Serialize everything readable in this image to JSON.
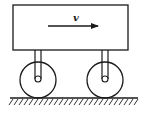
{
  "diagram": {
    "velocity_label": "v",
    "colors": {
      "stroke": "#1a1a1a",
      "background": "#ffffff"
    },
    "cart_body": {
      "x": 13,
      "y": 5,
      "width": 115,
      "height": 45
    },
    "velocity_arrow": {
      "x1": 48,
      "y1": 26,
      "x2": 98,
      "y2": 26,
      "label_x": 75,
      "label_y": 20
    },
    "wheels": [
      {
        "name": "left-wheel",
        "cx": 38,
        "cy": 80,
        "r": 18,
        "axle_r": 3
      },
      {
        "name": "right-wheel",
        "cx": 105,
        "cy": 80,
        "r": 18,
        "axle_r": 3
      }
    ],
    "ground": {
      "x1": 10,
      "x2": 138,
      "y": 98
    }
  }
}
